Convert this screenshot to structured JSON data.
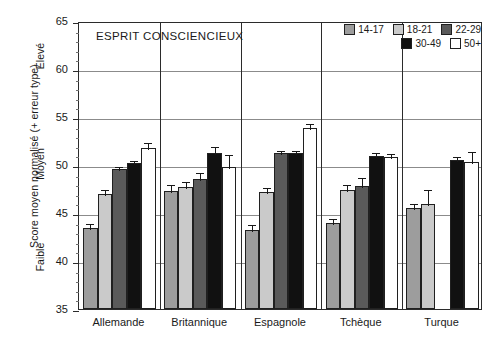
{
  "chart_data": {
    "type": "bar",
    "title": "ESPRIT CONSCIENCIEUX",
    "xlabel": "",
    "ylabel": "Score moyen normalisé (+ erreur type)",
    "ylim": [
      35,
      65
    ],
    "ytick_step": 5,
    "yminor_step": 1,
    "grid": true,
    "legend_position": "top-right",
    "categories": [
      "Allemande",
      "Britannique",
      "Espagnole",
      "Tchèque",
      "Turque"
    ],
    "yticks": [
      "65",
      "60",
      "55",
      "50",
      "45",
      "40",
      "35"
    ],
    "band_labels": [
      "Élevé",
      "Moyen",
      "Faible"
    ],
    "series": [
      {
        "name": "14-17",
        "color": "#9d9d9d",
        "values": [
          43.4,
          47.3,
          43.2,
          44.0,
          45.5
        ],
        "errors": [
          0.65,
          0.8,
          0.75,
          0.6,
          0.6
        ]
      },
      {
        "name": "18-21",
        "color": "#cacaca",
        "values": [
          47.0,
          47.7,
          47.2,
          47.4,
          45.9
        ],
        "errors": [
          0.6,
          0.75,
          0.6,
          0.7,
          1.7
        ]
      },
      {
        "name": "22-29",
        "color": "#5a5a5a",
        "values": [
          49.6,
          48.5,
          51.2,
          47.8,
          null
        ],
        "errors": [
          0.45,
          0.9,
          0.5,
          1.1,
          null
        ]
      },
      {
        "name": "30-49",
        "color": "#111111",
        "values": [
          50.2,
          51.2,
          51.2,
          50.9,
          50.5
        ],
        "errors": [
          0.4,
          0.9,
          0.5,
          0.6,
          0.5
        ]
      },
      {
        "name": "50+",
        "color": "#ffffff",
        "values": [
          51.8,
          49.8,
          53.9,
          50.8,
          50.3
        ],
        "errors": [
          0.7,
          1.5,
          0.6,
          0.6,
          1.3
        ]
      }
    ]
  },
  "legend": {
    "row1": [
      "14-17",
      "18-21",
      "22-29"
    ],
    "row2": [
      "30-49",
      "50+"
    ]
  }
}
